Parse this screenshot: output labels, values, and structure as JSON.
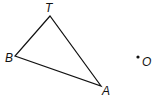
{
  "diagram": {
    "triangle": {
      "vertices": [
        {
          "name": "T",
          "x": 50,
          "y": 16,
          "label_x": 45,
          "label_y": 12
        },
        {
          "name": "B",
          "x": 15,
          "y": 56,
          "label_x": 5,
          "label_y": 62
        },
        {
          "name": "A",
          "x": 101,
          "y": 86,
          "label_x": 102,
          "label_y": 95
        }
      ]
    },
    "point": {
      "name": "O",
      "x": 138,
      "y": 57,
      "label_x": 142,
      "label_y": 66
    }
  },
  "labels": {
    "T": "T",
    "B": "B",
    "A": "A",
    "O": "O"
  }
}
